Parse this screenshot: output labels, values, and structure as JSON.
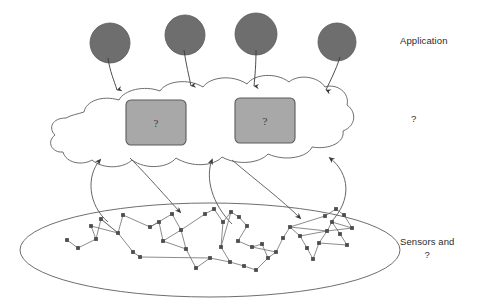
{
  "figure": {
    "background": "#ffffff"
  },
  "labels": {
    "application": "Application",
    "cloud": "?",
    "sensors_line1": "Sensors and",
    "sensors_line2": "?"
  },
  "colors": {
    "ink": "#4a4a4a",
    "circle_fill": "#6e6e6e",
    "circle_stroke": "#555555",
    "box_fill": "#a8a8a8",
    "box_stroke": "#5a5a5a",
    "node_fill": "#4d4d4d",
    "edge": "#6d6d6d",
    "text": "#2b2b2b"
  },
  "application_tier": {
    "glyph": "filled-circle",
    "count": 4,
    "nodes": [
      {
        "cx": 110,
        "cy": 43,
        "r": 20
      },
      {
        "cx": 185,
        "cy": 35,
        "r": 20
      },
      {
        "cx": 256,
        "cy": 34,
        "r": 21
      },
      {
        "cx": 337,
        "cy": 42,
        "r": 19
      }
    ],
    "arrows": [
      {
        "x1": 110,
        "y1": 63,
        "x2": 117,
        "y2": 92
      },
      {
        "x1": 185,
        "y1": 55,
        "x2": 190,
        "y2": 88
      },
      {
        "x1": 256,
        "y1": 55,
        "x2": 253,
        "y2": 88
      },
      {
        "x1": 337,
        "y1": 61,
        "x2": 326,
        "y2": 92
      }
    ]
  },
  "cloud_tier": {
    "shape": "hand-drawn-cloud",
    "boxes": [
      {
        "x": 126,
        "y": 100,
        "w": 60,
        "h": 45,
        "label": "?"
      },
      {
        "x": 235,
        "y": 98,
        "w": 60,
        "h": 45,
        "label": "?"
      }
    ]
  },
  "link_arrows": {
    "description": "curved bidirectional arrows between cloud and sensor ellipse",
    "count": 4
  },
  "sensor_tier": {
    "ellipse": {
      "cx": 210,
      "cy": 250,
      "rx": 190,
      "ry": 47
    },
    "node_count": 46,
    "nodes": [
      [
        67,
        240
      ],
      [
        78,
        248
      ],
      [
        91,
        226
      ],
      [
        96,
        239
      ],
      [
        101,
        219
      ],
      [
        123,
        215
      ],
      [
        118,
        233
      ],
      [
        133,
        252
      ],
      [
        140,
        257
      ],
      [
        150,
        227
      ],
      [
        159,
        222
      ],
      [
        163,
        241
      ],
      [
        172,
        214
      ],
      [
        181,
        230
      ],
      [
        186,
        249
      ],
      [
        196,
        268
      ],
      [
        210,
        258
      ],
      [
        205,
        214
      ],
      [
        214,
        209
      ],
      [
        223,
        222
      ],
      [
        231,
        212
      ],
      [
        239,
        217
      ],
      [
        247,
        226
      ],
      [
        238,
        241
      ],
      [
        252,
        247
      ],
      [
        221,
        247
      ],
      [
        230,
        262
      ],
      [
        244,
        266
      ],
      [
        256,
        270
      ],
      [
        268,
        258
      ],
      [
        262,
        244
      ],
      [
        276,
        252
      ],
      [
        283,
        238
      ],
      [
        290,
        227
      ],
      [
        300,
        236
      ],
      [
        307,
        248
      ],
      [
        313,
        259
      ],
      [
        319,
        243
      ],
      [
        327,
        231
      ],
      [
        332,
        222
      ],
      [
        340,
        234
      ],
      [
        347,
        245
      ],
      [
        352,
        228
      ],
      [
        344,
        215
      ],
      [
        336,
        209
      ],
      [
        325,
        216
      ]
    ],
    "edges": [
      [
        0,
        1
      ],
      [
        1,
        3
      ],
      [
        2,
        3
      ],
      [
        3,
        4
      ],
      [
        4,
        6
      ],
      [
        5,
        6
      ],
      [
        6,
        4
      ],
      [
        6,
        7
      ],
      [
        7,
        8
      ],
      [
        5,
        9
      ],
      [
        9,
        10
      ],
      [
        10,
        11
      ],
      [
        11,
        13
      ],
      [
        12,
        13
      ],
      [
        13,
        14
      ],
      [
        14,
        15
      ],
      [
        13,
        17
      ],
      [
        17,
        18
      ],
      [
        18,
        19
      ],
      [
        19,
        20
      ],
      [
        20,
        21
      ],
      [
        21,
        22
      ],
      [
        22,
        23
      ],
      [
        23,
        24
      ],
      [
        19,
        25
      ],
      [
        25,
        26
      ],
      [
        26,
        27
      ],
      [
        27,
        28
      ],
      [
        28,
        29
      ],
      [
        29,
        30
      ],
      [
        30,
        24
      ],
      [
        29,
        31
      ],
      [
        31,
        32
      ],
      [
        32,
        33
      ],
      [
        33,
        34
      ],
      [
        34,
        35
      ],
      [
        35,
        36
      ],
      [
        36,
        37
      ],
      [
        37,
        38
      ],
      [
        38,
        39
      ],
      [
        39,
        40
      ],
      [
        40,
        41
      ],
      [
        41,
        37
      ],
      [
        39,
        42
      ],
      [
        42,
        43
      ],
      [
        43,
        44
      ],
      [
        44,
        45
      ],
      [
        45,
        33
      ],
      [
        33,
        38
      ],
      [
        38,
        42
      ],
      [
        24,
        31
      ],
      [
        16,
        26
      ],
      [
        8,
        16
      ],
      [
        15,
        16
      ],
      [
        11,
        14
      ],
      [
        9,
        12
      ],
      [
        2,
        6
      ],
      [
        20,
        25
      ],
      [
        34,
        38
      ]
    ]
  }
}
